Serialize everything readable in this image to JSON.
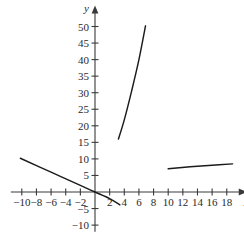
{
  "chart_data": {
    "type": "line",
    "title": "",
    "subtitle": "",
    "xlabel": "x",
    "ylabel": "y",
    "xlim": [
      -11.5,
      19.5
    ],
    "ylim": [
      -12,
      53
    ],
    "grid": false,
    "legend": null,
    "axis_style": "cartesian-arrows",
    "xticks": [
      -10,
      -8,
      -6,
      -4,
      -2,
      2,
      4,
      6,
      8,
      10,
      12,
      14,
      16,
      18
    ],
    "xtick_labels": [
      "-10",
      "-8",
      "-6",
      "-4",
      "-2",
      "2",
      "4",
      "6",
      "8",
      "10",
      "12",
      "14",
      "16",
      "18"
    ],
    "yticks": [
      -10,
      -5,
      5,
      10,
      15,
      20,
      25,
      30,
      35,
      40,
      45,
      50
    ],
    "ytick_labels": [
      "-10",
      "-5",
      "5",
      "10",
      "15",
      "20",
      "25",
      "30",
      "35",
      "40",
      "45",
      "50"
    ],
    "series": [
      {
        "name": "left-branch",
        "style": "solid",
        "color": "#1b1b1b",
        "x": [
          -10.2,
          -6.0,
          -2.0,
          0.0,
          2.0,
          3.4
        ],
        "y": [
          10.2,
          6.0,
          2.0,
          0.0,
          -2.0,
          -3.9
        ]
      },
      {
        "name": "steep-middle-branch",
        "style": "solid",
        "color": "#1b1b1b",
        "x": [
          3.2,
          4.0,
          5.0,
          6.0,
          6.9
        ],
        "y": [
          16.0,
          21.8,
          30.5,
          40.0,
          50.2
        ]
      },
      {
        "name": "right-branch",
        "style": "solid",
        "color": "#1b1b1b",
        "x": [
          10.0,
          13.0,
          16.0,
          18.8
        ],
        "y": [
          7.0,
          7.6,
          8.1,
          8.5
        ]
      }
    ]
  },
  "axes": {
    "x_label": "x",
    "y_label": "y"
  }
}
